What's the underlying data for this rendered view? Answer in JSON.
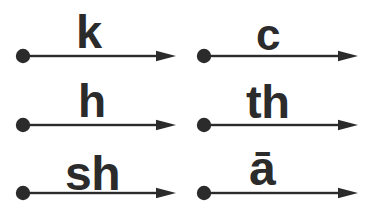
{
  "figure": {
    "kind": "phonetic-arrow-diagram",
    "background_color": "#ffffff",
    "ink_color": "#2b2b2b",
    "rows": 3,
    "columns": 2
  },
  "items": [
    {
      "id": "arrow-k",
      "label": "k",
      "row": 1,
      "column": 1,
      "dot_x": 23,
      "dot_y": 56,
      "tip_x": 176,
      "label_left": 76,
      "label_top": 8,
      "label_size": 47
    },
    {
      "id": "arrow-c",
      "label": "c",
      "row": 1,
      "column": 2,
      "dot_x": 204,
      "dot_y": 56,
      "tip_x": 358,
      "label_left": 256,
      "label_top": 13,
      "label_size": 44
    },
    {
      "id": "arrow-h",
      "label": "h",
      "row": 2,
      "column": 1,
      "dot_x": 23,
      "dot_y": 125,
      "tip_x": 176,
      "label_left": 78,
      "label_top": 78,
      "label_size": 46
    },
    {
      "id": "arrow-th",
      "label": "th",
      "row": 2,
      "column": 2,
      "dot_x": 204,
      "dot_y": 125,
      "tip_x": 358,
      "label_left": 246,
      "label_top": 78,
      "label_size": 47
    },
    {
      "id": "arrow-sh",
      "label": "sh",
      "row": 3,
      "column": 1,
      "dot_x": 23,
      "dot_y": 193,
      "tip_x": 176,
      "label_left": 65,
      "label_top": 150,
      "label_size": 48
    },
    {
      "id": "arrow-a-macron",
      "label": "ā",
      "row": 3,
      "column": 2,
      "dot_x": 204,
      "dot_y": 193,
      "tip_x": 358,
      "label_left": 249,
      "label_top": 145,
      "label_size": 48
    }
  ]
}
